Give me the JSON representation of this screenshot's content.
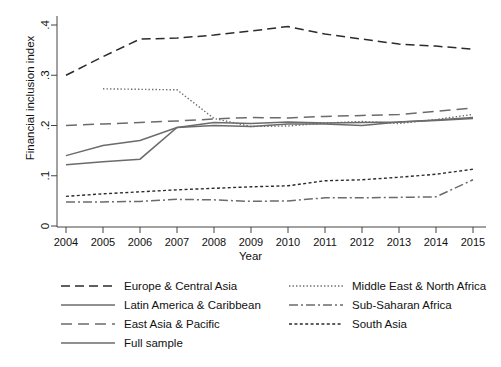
{
  "chart_data": {
    "type": "line",
    "title": "",
    "xlabel": "Year",
    "ylabel": "Financial inclusion index",
    "x": [
      2004,
      2005,
      2006,
      2007,
      2008,
      2009,
      2010,
      2011,
      2012,
      2013,
      2014,
      2015
    ],
    "xticklabels": [
      "2004",
      "2005",
      "2006",
      "2007",
      "2008",
      "2009",
      "2010",
      "2011",
      "2012",
      "2013",
      "2014",
      "2015"
    ],
    "yticklabels": [
      "0",
      ".1",
      ".2",
      ".3",
      ".4"
    ],
    "ytickvalues": [
      0,
      0.1,
      0.2,
      0.3,
      0.4
    ],
    "xlim": [
      2004,
      2015
    ],
    "ylim": [
      0,
      0.42
    ],
    "grid": false,
    "legend_position": "below-axes",
    "series": [
      {
        "name": "Europe & Central Asia",
        "style": "dashed",
        "color": "#2b2b2b",
        "values": [
          0.3,
          0.337,
          0.372,
          0.374,
          0.38,
          0.388,
          0.397,
          0.382,
          0.372,
          0.362,
          0.358,
          0.352
        ]
      },
      {
        "name": "Latin America & Caribbean",
        "style": "solid",
        "color": "#6b6b6b",
        "values": [
          0.122,
          0.128,
          0.133,
          0.196,
          0.2,
          0.198,
          0.203,
          0.203,
          0.2,
          0.207,
          0.21,
          0.214
        ]
      },
      {
        "name": "East Asia & Pacific",
        "style": "long-dash",
        "color": "#6b6b6b",
        "values": [
          0.2,
          0.203,
          0.206,
          0.209,
          0.213,
          0.216,
          0.215,
          0.218,
          0.22,
          0.222,
          0.228,
          0.235
        ]
      },
      {
        "name": "Full sample",
        "style": "solid",
        "color": "#6b6b6b",
        "values": [
          0.14,
          0.16,
          0.17,
          0.196,
          0.206,
          0.204,
          0.207,
          0.205,
          0.206,
          0.207,
          0.211,
          0.216
        ]
      },
      {
        "name": "Middle East & North Africa",
        "style": "dotted",
        "color": "#6b6b6b",
        "values": [
          null,
          0.273,
          0.272,
          0.271,
          0.214,
          0.198,
          0.199,
          0.205,
          0.208,
          0.204,
          0.212,
          0.222
        ]
      },
      {
        "name": "Sub-Saharan Africa",
        "style": "dash-dot",
        "color": "#6b6b6b",
        "values": [
          0.048,
          0.048,
          0.049,
          0.053,
          0.052,
          0.049,
          0.05,
          0.056,
          0.056,
          0.057,
          0.058,
          0.092
        ]
      },
      {
        "name": "South Asia",
        "style": "fine-dash",
        "color": "#2b2b2b",
        "values": [
          0.059,
          0.064,
          0.068,
          0.072,
          0.075,
          0.078,
          0.08,
          0.09,
          0.092,
          0.097,
          0.103,
          0.113
        ]
      }
    ]
  },
  "legend": {
    "left_items": [
      {
        "label": "Europe & Central Asia",
        "style": "dashed"
      },
      {
        "label": "Latin America & Caribbean",
        "style": "solid"
      },
      {
        "label": "East Asia & Pacific",
        "style": "long-dash"
      },
      {
        "label": "Full sample",
        "style": "solid"
      }
    ],
    "right_items": [
      {
        "label": "Middle East & North Africa",
        "style": "dotted"
      },
      {
        "label": "Sub-Saharan Africa",
        "style": "dash-dot"
      },
      {
        "label": "South Asia",
        "style": "fine-dash"
      }
    ]
  }
}
